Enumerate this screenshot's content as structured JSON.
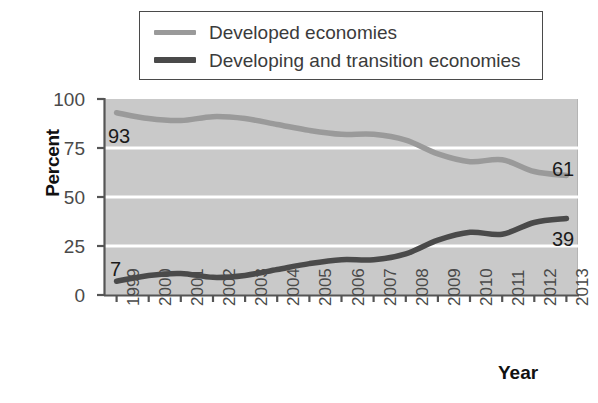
{
  "chart_data": {
    "type": "line",
    "title": "",
    "xlabel": "Year",
    "ylabel": "Percent",
    "ylim": [
      0,
      100
    ],
    "yticks": [
      "0",
      "25",
      "50",
      "75",
      "100"
    ],
    "grid": "horizontal-white",
    "legend_position": "top",
    "categories": [
      "1999",
      "2000",
      "2001",
      "2002",
      "2003",
      "2004",
      "2005",
      "2006",
      "2007",
      "2008",
      "2009",
      "2010",
      "2011",
      "2012",
      "2013"
    ],
    "series": [
      {
        "name": "Developed economies",
        "color": "#9a9a9a",
        "values": [
          93,
          90,
          89,
          91,
          90,
          87,
          84,
          82,
          82,
          79,
          72,
          68,
          69,
          63,
          61
        ],
        "start_label": "93",
        "end_label": "61"
      },
      {
        "name": "Developing and transition economies",
        "color": "#4a4a4a",
        "values": [
          7,
          10,
          11,
          9,
          10,
          13,
          16,
          18,
          18,
          21,
          28,
          32,
          31,
          37,
          39
        ],
        "start_label": "7",
        "end_label": "39"
      }
    ]
  },
  "legend": {
    "items": [
      {
        "label": "Developed economies",
        "swatch": "line-swatch-light"
      },
      {
        "label": "Developing and transition economies",
        "swatch": "line-swatch-dark"
      }
    ]
  },
  "axes": {
    "y_title": "Percent",
    "x_title": "Year",
    "y_ticks": [
      "100",
      "75",
      "50",
      "25",
      "0"
    ],
    "x_ticks": [
      "1999",
      "2000",
      "2001",
      "2002",
      "2003",
      "2004",
      "2005",
      "2006",
      "2007",
      "2008",
      "2009",
      "2010",
      "2011",
      "2012",
      "2013"
    ]
  },
  "annotations": {
    "left_top": "93",
    "left_bottom": "7",
    "right_top": "61",
    "right_bottom": "39"
  },
  "colors": {
    "plot_background": "#c9c9c9",
    "gridline": "#ffffff",
    "series_light": "#9a9a9a",
    "series_dark": "#4a4a4a",
    "axis": "#555555",
    "legend_border": "#4a4a4a"
  }
}
